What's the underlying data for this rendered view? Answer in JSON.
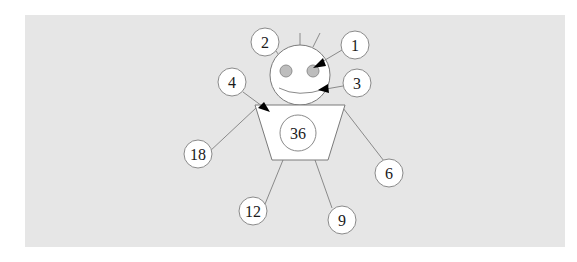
{
  "diagram": {
    "type": "labeled-figure",
    "colors": {
      "panel_background": "#e6e6e6",
      "page_background": "#ffffff",
      "shape_fill": "#ffffff",
      "stroke": "#8a8a8a",
      "eye_fill": "#bdbdbd",
      "arrow": "#000000",
      "text": "#1a1a1a"
    },
    "body_label": "36",
    "callouts": [
      {
        "id": "c1",
        "label": "1",
        "target": "right-eye",
        "pointer": "arrow"
      },
      {
        "id": "c2",
        "label": "2",
        "target": "head-top-left",
        "pointer": "line"
      },
      {
        "id": "c3",
        "label": "3",
        "target": "mouth",
        "pointer": "arrow"
      },
      {
        "id": "c4",
        "label": "4",
        "target": "body-top-left-corner",
        "pointer": "arrow"
      },
      {
        "id": "c18",
        "label": "18",
        "target": "left-arm",
        "pointer": "line"
      },
      {
        "id": "c6",
        "label": "6",
        "target": "right-arm",
        "pointer": "line"
      },
      {
        "id": "c12",
        "label": "12",
        "target": "left-leg",
        "pointer": "line"
      },
      {
        "id": "c9",
        "label": "9",
        "target": "right-leg",
        "pointer": "line"
      }
    ]
  }
}
